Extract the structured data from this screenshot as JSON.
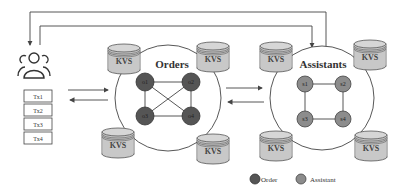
{
  "diagram": {
    "client": {
      "icon": "users-icon",
      "transactions": [
        "Tx1",
        "Tx2",
        "Tx3",
        "Tx4"
      ]
    },
    "clusters": [
      {
        "id": "orders",
        "title": "Orders",
        "node_color": "#555555",
        "nodes": [
          "o1",
          "o2",
          "o3",
          "o4"
        ],
        "topology": "fully-connected",
        "kvs_label": "KVS"
      },
      {
        "id": "assistants",
        "title": "Assistants",
        "node_color": "#8c8c8c",
        "nodes": [
          "s1",
          "s2",
          "s3",
          "s4"
        ],
        "topology": "ring",
        "kvs_label": "KVS"
      }
    ],
    "legend": [
      {
        "label": "Order",
        "color": "#555555"
      },
      {
        "label": "Assistant",
        "color": "#8c8c8c"
      }
    ],
    "colors": {
      "kvs_fill": "#c8c8c8",
      "line": "#444444"
    }
  }
}
